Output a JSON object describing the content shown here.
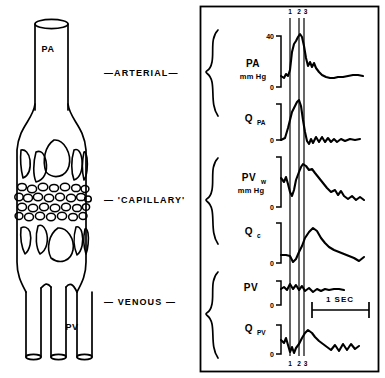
{
  "figure": {
    "diagram": {
      "vessel_tags": [
        {
          "id": "pa",
          "label": "PA",
          "x": 48,
          "y": 52
        },
        {
          "id": "pv",
          "label": "PV",
          "x": 72,
          "y": 330
        }
      ],
      "region_labels": [
        {
          "id": "arterial",
          "text": "—ARTERIAL—",
          "x": 104,
          "y": 73
        },
        {
          "id": "capillary",
          "text": "— 'CAPILLARY'",
          "x": 104,
          "y": 200
        },
        {
          "id": "venous",
          "text": "— VENOUS —",
          "x": 104,
          "y": 302
        }
      ]
    },
    "panel": {
      "marker_labels_top": [
        "1",
        "2",
        "3"
      ],
      "marker_labels_bottom": [
        "1",
        "2",
        "3"
      ],
      "time_bar": {
        "label": "1  SEC"
      },
      "traces": [
        {
          "id": "pa-pressure",
          "name": "PA",
          "subscript": "",
          "units": "mm Hg",
          "scale_top": "40",
          "scale_bottom": "0",
          "group": "arterial"
        },
        {
          "id": "q-pa",
          "name": "Q",
          "subscript": "PA",
          "units": "",
          "scale_top": "",
          "scale_bottom": "0",
          "group": "arterial"
        },
        {
          "id": "pv-wedge",
          "name": "PV",
          "subscript": "w",
          "units": "mm Hg",
          "scale_top": "",
          "scale_bottom": "0",
          "group": "capillary"
        },
        {
          "id": "q-c",
          "name": "Q",
          "subscript": "c",
          "units": "",
          "scale_top": "",
          "scale_bottom": "0",
          "group": "capillary"
        },
        {
          "id": "pv-pressure",
          "name": "PV",
          "subscript": "",
          "units": "",
          "scale_top": "",
          "scale_bottom": "0",
          "group": "venous"
        },
        {
          "id": "q-pv",
          "name": "Q",
          "subscript": "PV",
          "units": "",
          "scale_top": "",
          "scale_bottom": "0",
          "group": "venous"
        }
      ]
    },
    "colors": {
      "ink": "#000000",
      "paper": "#ffffff"
    }
  }
}
